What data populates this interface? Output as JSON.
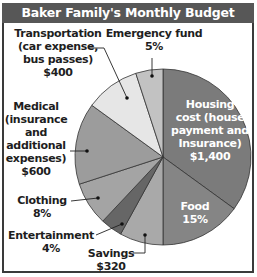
{
  "chart_data": {
    "type": "pie",
    "title": "Baker Family's Monthly Budget",
    "start_angle": "12 o'clock",
    "direction": "clockwise",
    "slices": [
      {
        "name": "Housing cost (house payment and Insurance)",
        "label": "Housing cost (house payment and Insurance) $1,400",
        "value": 1400,
        "percent": 35,
        "color": "#7b7b7b"
      },
      {
        "name": "Food",
        "label": "Food 15%",
        "value": 600,
        "percent": 15,
        "color": "#858585"
      },
      {
        "name": "Savings",
        "label": "Savings $320",
        "value": 320,
        "percent": 8,
        "color": "#a9a9a9"
      },
      {
        "name": "Entertainment",
        "label": "Entertainment 4%",
        "value": 160,
        "percent": 4,
        "color": "#666666"
      },
      {
        "name": "Clothing",
        "label": "Clothing 8%",
        "value": 320,
        "percent": 8,
        "color": "#a4a4a4"
      },
      {
        "name": "Medical (insurance and additional expenses)",
        "label": "Medical (insurance and additional expenses) $600",
        "value": 600,
        "percent": 15,
        "color": "#9c9c9c"
      },
      {
        "name": "Transportation (car expense, bus passes)",
        "label": "Transportation (car expense, bus passes) $400",
        "value": 400,
        "percent": 10,
        "color": "#e6e6e6"
      },
      {
        "name": "Emergency fund",
        "label": "Emergency fund 5%",
        "value": 200,
        "percent": 5,
        "color": "#c2c2c2"
      }
    ],
    "total": 4000
  },
  "title": "Baker Family's Monthly Budget",
  "labels": {
    "transportation": [
      "Transportation",
      "(car expense,",
      "bus passes)",
      "$400"
    ],
    "emergency": [
      "Emergency fund",
      "5%"
    ],
    "medical": [
      "Medical",
      "(insurance",
      "and",
      "additional",
      "expenses)",
      "$600"
    ],
    "housing": [
      "Housing",
      "cost (house",
      "payment and",
      "Insurance)",
      "$1,400"
    ],
    "food": [
      "Food",
      "15%"
    ],
    "clothing": [
      "Clothing",
      "8%"
    ],
    "entertainment": [
      "Entertainment",
      "4%"
    ],
    "savings": [
      "Savings",
      "$320"
    ]
  }
}
